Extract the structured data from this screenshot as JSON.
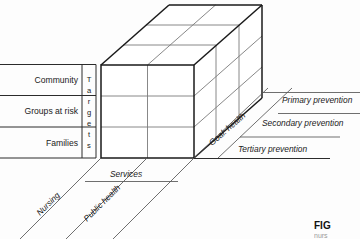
{
  "figure": {
    "title_fragment": "FIG",
    "subtitle_fragment": "nurs",
    "background_color": "#fdfdfd",
    "ink_color": "#1a1a1a"
  },
  "axes": {
    "vertical_axis": {
      "name": "Targets",
      "label": "Targets",
      "label_letters": [
        "T",
        "a",
        "r",
        "g",
        "e",
        "t",
        "s"
      ],
      "categories": [
        {
          "label": "Community"
        },
        {
          "label": "Groups at risk"
        },
        {
          "label": "Families"
        }
      ]
    },
    "horizontal_axis": {
      "name": "Services",
      "label": "Services",
      "categories": [
        {
          "label": "Nursing"
        },
        {
          "label": "Public health"
        }
      ]
    },
    "depth_axis": {
      "name": "Goal: health",
      "label": "Goal: health",
      "categories": [
        {
          "label": "Primary prevention"
        },
        {
          "label": "Secondary prevention"
        },
        {
          "label": "Tertiary prevention"
        }
      ]
    }
  },
  "cube": {
    "columns": 2,
    "rows": 3,
    "layers": 3
  }
}
